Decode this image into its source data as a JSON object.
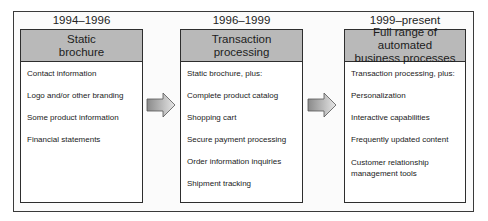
{
  "stages": [
    {
      "period": "1994–1996",
      "title_line1": "Static",
      "title_line2": "brochure",
      "items": [
        "Contact information",
        "Logo and/or other branding",
        "Some product information",
        "Financial statements"
      ]
    },
    {
      "period": "1996–1999",
      "title_line1": "Transaction",
      "title_line2": "processing",
      "items": [
        "Static brochure, plus:",
        "Complete product catalog",
        "Shopping cart",
        "Secure payment processing",
        "Order information inquiries",
        "Shipment tracking"
      ]
    },
    {
      "period": "1999–present",
      "title_line1": "Full range of automated",
      "title_line2": "business processes",
      "items": [
        "Transaction processing, plus:",
        "Personalization",
        "Interactive capabilities",
        "Frequently updated content",
        "Customer relationship",
        "management tools"
      ]
    }
  ],
  "arrows": [
    {
      "from": "Static brochure",
      "to": "Transaction processing",
      "icon": "right-arrow-icon"
    },
    {
      "from": "Transaction processing",
      "to": "Full range of automated business processes",
      "icon": "right-arrow-icon"
    }
  ],
  "colors": {
    "header_fill": "#b9b9b9",
    "border": "#2e2e2e",
    "arrow_fill_dark": "#8a8a8a",
    "arrow_fill_light": "#e6e6e6"
  }
}
